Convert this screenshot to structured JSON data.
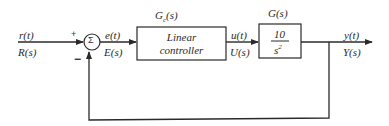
{
  "diagram": {
    "type": "feedback-control-block-diagram",
    "input": {
      "time_label": "r(t)",
      "laplace_label": "R(s)"
    },
    "summing_junction": {
      "symbol": "Σ",
      "plus_sign": "+",
      "minus_sign": "−"
    },
    "error": {
      "time_label": "e(t)",
      "laplace_label": "E(s)"
    },
    "controller": {
      "transfer_label_base": "G",
      "transfer_label_sub": "c",
      "transfer_label_arg": "(s)",
      "line1": "Linear",
      "line2": "controller"
    },
    "control_signal": {
      "time_label": "u(t)",
      "laplace_label": "U(s)"
    },
    "plant": {
      "transfer_label": "G(s)",
      "numerator": "10",
      "denominator_base": "s",
      "denominator_exp": "2"
    },
    "output": {
      "time_label": "y(t)",
      "laplace_label": "Y(s)"
    },
    "feedback": {
      "type": "unity",
      "sign": "negative"
    },
    "colors": {
      "line": "#2a2a2a",
      "background": "#ffffff"
    }
  }
}
